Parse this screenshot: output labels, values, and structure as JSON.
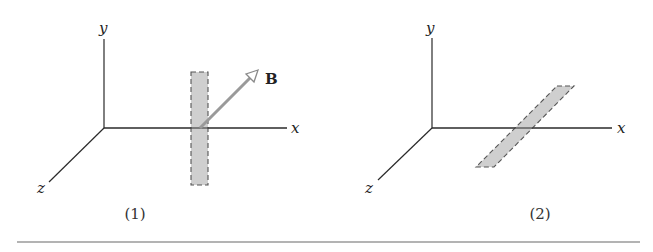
{
  "figures": [
    {
      "caption": "(1)",
      "axes": {
        "x": "x",
        "y": "y",
        "z": "z"
      },
      "vector_label": "B",
      "loop_orientation": "perpendicular to x-axis (in y-z plane)"
    },
    {
      "caption": "(2)",
      "axes": {
        "x": "x",
        "y": "y",
        "z": "z"
      },
      "loop_orientation": "lying in x-z plane"
    }
  ],
  "colors": {
    "axis": "#2a2a2a",
    "loop_fill": "#cfcfcf",
    "vector": "#9a9a9a"
  }
}
